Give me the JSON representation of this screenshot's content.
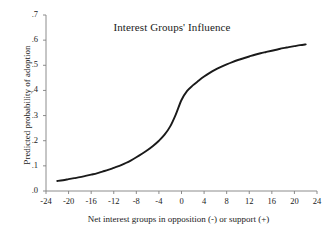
{
  "chart_data": {
    "type": "line",
    "title": "Interest Groups' Influence",
    "xlabel": "Net interest groups in opposition (-) or support (+)",
    "ylabel": "Predicted probability of adoption",
    "xlim": [
      -24,
      24
    ],
    "ylim": [
      0.0,
      0.7
    ],
    "grid": false,
    "legend": null,
    "xticks": [
      -24,
      -20,
      -16,
      -12,
      -8,
      -4,
      0,
      4,
      8,
      12,
      16,
      20,
      24
    ],
    "xtick_labels": [
      "-24",
      "-20",
      "-16",
      "-12",
      "-8",
      "-4",
      "0",
      "4",
      "8",
      "12",
      "16",
      "20",
      "24"
    ],
    "yticks": [
      0.0,
      0.1,
      0.2,
      0.3,
      0.4,
      0.5,
      0.6,
      0.7
    ],
    "ytick_labels": [
      ".0",
      ".1",
      ".2",
      ".3",
      ".4",
      ".5",
      ".6",
      ".7"
    ],
    "line_color": "#1a1a1a",
    "line_width": 1.9,
    "series": [
      {
        "name": "Predicted probability of adoption",
        "x": [
          -22,
          -21,
          -20,
          -19,
          -18,
          -17,
          -16,
          -15,
          -14,
          -13,
          -12,
          -11,
          -10,
          -9,
          -8,
          -7,
          -6,
          -5,
          -4,
          -3,
          -2,
          -1,
          0,
          1,
          2,
          3,
          4,
          5,
          6,
          7,
          8,
          9,
          10,
          11,
          12,
          13,
          14,
          15,
          16,
          17,
          18,
          19,
          20,
          21,
          22
        ],
        "y": [
          0.04,
          0.043,
          0.047,
          0.051,
          0.055,
          0.06,
          0.065,
          0.07,
          0.077,
          0.084,
          0.092,
          0.1,
          0.11,
          0.121,
          0.134,
          0.148,
          0.163,
          0.18,
          0.2,
          0.224,
          0.257,
          0.305,
          0.362,
          0.398,
          0.42,
          0.438,
          0.455,
          0.47,
          0.483,
          0.494,
          0.504,
          0.513,
          0.521,
          0.528,
          0.535,
          0.542,
          0.548,
          0.553,
          0.558,
          0.563,
          0.568,
          0.572,
          0.576,
          0.58,
          0.583
        ]
      }
    ]
  }
}
